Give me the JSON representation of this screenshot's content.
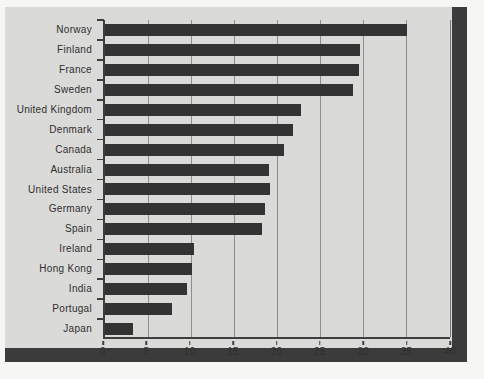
{
  "colors": {
    "page_bg": "#f6f6f4",
    "card_bg": "#dadad8",
    "bar": "#333333",
    "grid": "#8e8e8c",
    "axis": "#3e3e3e",
    "shadow": "#3b3b3b",
    "text": "#2f2f2f"
  },
  "chart_data": {
    "type": "bar",
    "orientation": "horizontal",
    "title": "",
    "xlabel": "",
    "ylabel": "",
    "grid": true,
    "legend": "none",
    "xlim": [
      0,
      40
    ],
    "xticks": [
      0,
      5,
      10,
      15,
      20,
      25,
      30,
      35,
      40
    ],
    "categories": [
      "Norway",
      "Finland",
      "France",
      "Sweden",
      "United Kingdom",
      "Denmark",
      "Canada",
      "Australia",
      "United States",
      "Germany",
      "Spain",
      "Ireland",
      "Hong Kong",
      "India",
      "Portugal",
      "Japan"
    ],
    "values": [
      35.0,
      29.6,
      29.4,
      28.7,
      22.7,
      21.8,
      20.7,
      19.0,
      19.1,
      18.5,
      18.2,
      10.3,
      10.1,
      9.5,
      7.8,
      3.3
    ]
  }
}
